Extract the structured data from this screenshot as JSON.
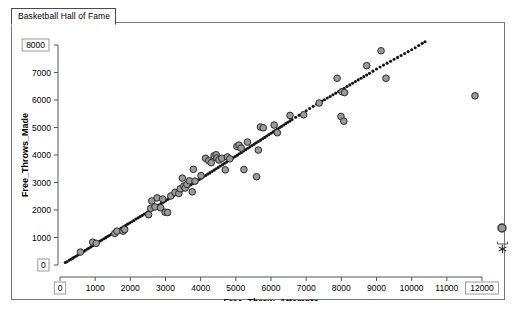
{
  "window": {
    "tab_label": "Basketball Hall of Fame"
  },
  "axis_boxes": {
    "y_max_label": "8000",
    "y_min_label": "0",
    "x_min_label": "0",
    "x_max_label": "12000"
  },
  "tools": {
    "point_icon_name": "circle-point-icon",
    "star_icon_name": "asterisk-icon"
  },
  "chart_data": {
    "type": "scatter",
    "title": "Basketball Hall of Fame",
    "xlabel": "Free_Throw_Attempts",
    "ylabel": "Free_Throws_Made",
    "xlim": [
      0,
      12000
    ],
    "ylim": [
      0,
      8000
    ],
    "xticks": [
      0,
      1000,
      2000,
      3000,
      4000,
      5000,
      6000,
      7000,
      8000,
      9000,
      10000,
      11000,
      12000
    ],
    "yticks": [
      0,
      1000,
      2000,
      3000,
      4000,
      5000,
      6000,
      7000,
      8000
    ],
    "xtick_labels": [
      "0",
      "1000",
      "2000",
      "3000",
      "4000",
      "5000",
      "6000",
      "7000",
      "8000",
      "9000",
      "10000",
      "11000",
      "12000"
    ],
    "ytick_labels": [
      "0",
      "1000",
      "2000",
      "3000",
      "4000",
      "5000",
      "6000",
      "7000",
      "8000"
    ],
    "grid": false,
    "legend": false,
    "marker_fill": "#9a9a9a",
    "marker_edge": "#2b2b2b",
    "dense_color": "#141414",
    "series": [
      {
        "name": "dense_trend_points",
        "marker": "small-dot",
        "color": "#141414",
        "points": [
          [
            150,
            90
          ],
          [
            200,
            120
          ],
          [
            260,
            170
          ],
          [
            310,
            210
          ],
          [
            360,
            250
          ],
          [
            410,
            290
          ],
          [
            470,
            330
          ],
          [
            520,
            375
          ],
          [
            570,
            415
          ],
          [
            620,
            455
          ],
          [
            670,
            495
          ],
          [
            720,
            535
          ],
          [
            780,
            580
          ],
          [
            830,
            620
          ],
          [
            880,
            660
          ],
          [
            930,
            700
          ],
          [
            980,
            740
          ],
          [
            1040,
            790
          ],
          [
            1090,
            830
          ],
          [
            1140,
            870
          ],
          [
            1190,
            910
          ],
          [
            1250,
            955
          ],
          [
            1300,
            995
          ],
          [
            1350,
            1035
          ],
          [
            1400,
            1075
          ],
          [
            1460,
            1120
          ],
          [
            1510,
            1160
          ],
          [
            1560,
            1200
          ],
          [
            1620,
            1250
          ],
          [
            1680,
            1300
          ],
          [
            1740,
            1345
          ],
          [
            1800,
            1390
          ],
          [
            1860,
            1435
          ],
          [
            1920,
            1485
          ],
          [
            1980,
            1530
          ],
          [
            2040,
            1575
          ],
          [
            2100,
            1620
          ],
          [
            2160,
            1670
          ],
          [
            2220,
            1715
          ],
          [
            2280,
            1760
          ],
          [
            2340,
            1805
          ],
          [
            2400,
            1855
          ],
          [
            2460,
            1900
          ],
          [
            2520,
            1950
          ],
          [
            2580,
            1995
          ],
          [
            2640,
            2045
          ],
          [
            2700,
            2095
          ],
          [
            2760,
            2140
          ],
          [
            2820,
            2190
          ],
          [
            2880,
            2240
          ],
          [
            2940,
            2285
          ],
          [
            3000,
            2330
          ],
          [
            3060,
            2380
          ],
          [
            3120,
            2430
          ],
          [
            3180,
            2475
          ],
          [
            3240,
            2525
          ],
          [
            3300,
            2575
          ],
          [
            3360,
            2620
          ],
          [
            3420,
            2670
          ],
          [
            3480,
            2720
          ],
          [
            3540,
            2770
          ],
          [
            3600,
            2815
          ],
          [
            3660,
            2865
          ],
          [
            3720,
            2915
          ],
          [
            3780,
            2960
          ],
          [
            3840,
            3010
          ],
          [
            3900,
            3060
          ],
          [
            3960,
            3110
          ],
          [
            4020,
            3155
          ],
          [
            4080,
            3205
          ],
          [
            4140,
            3255
          ],
          [
            4200,
            3305
          ],
          [
            4260,
            3350
          ],
          [
            4320,
            3400
          ],
          [
            4380,
            3450
          ],
          [
            4440,
            3500
          ],
          [
            4500,
            3550
          ],
          [
            4560,
            3600
          ],
          [
            4620,
            3650
          ],
          [
            4680,
            3700
          ],
          [
            4740,
            3750
          ],
          [
            4800,
            3800
          ],
          [
            4860,
            3845
          ],
          [
            4920,
            3895
          ],
          [
            4980,
            3945
          ],
          [
            5040,
            3995
          ],
          [
            5100,
            4045
          ],
          [
            5160,
            4095
          ],
          [
            5220,
            4145
          ],
          [
            5280,
            4195
          ],
          [
            5340,
            4245
          ],
          [
            5400,
            4295
          ],
          [
            5460,
            4345
          ],
          [
            5520,
            4395
          ],
          [
            5580,
            4445
          ],
          [
            5640,
            4490
          ],
          [
            5700,
            4540
          ],
          [
            5760,
            4590
          ],
          [
            5820,
            4640
          ],
          [
            5880,
            4690
          ],
          [
            5940,
            4740
          ],
          [
            6000,
            4790
          ],
          [
            6060,
            4840
          ],
          [
            6120,
            4890
          ],
          [
            6180,
            4940
          ],
          [
            6240,
            4990
          ],
          [
            6300,
            5040
          ],
          [
            6360,
            5090
          ],
          [
            6420,
            5140
          ],
          [
            6480,
            5190
          ],
          [
            6540,
            5240
          ],
          [
            6600,
            5290
          ],
          [
            6700,
            5370
          ],
          [
            6800,
            5450
          ],
          [
            6900,
            5530
          ],
          [
            7000,
            5610
          ],
          [
            7100,
            5690
          ],
          [
            7200,
            5770
          ],
          [
            7300,
            5850
          ],
          [
            7380,
            5910
          ],
          [
            7450,
            5960
          ],
          [
            7520,
            6010
          ],
          [
            7600,
            6070
          ],
          [
            7680,
            6130
          ],
          [
            7760,
            6190
          ],
          [
            7840,
            6250
          ],
          [
            7920,
            6310
          ],
          [
            8000,
            6370
          ],
          [
            8080,
            6430
          ],
          [
            8160,
            6490
          ],
          [
            8240,
            6550
          ],
          [
            8320,
            6610
          ],
          [
            8400,
            6670
          ],
          [
            8480,
            6730
          ],
          [
            8560,
            6790
          ],
          [
            8640,
            6850
          ],
          [
            8720,
            6910
          ],
          [
            8800,
            6970
          ],
          [
            8900,
            7050
          ],
          [
            9000,
            7130
          ],
          [
            9100,
            7200
          ],
          [
            9200,
            7270
          ],
          [
            9300,
            7340
          ],
          [
            9400,
            7410
          ],
          [
            9500,
            7480
          ],
          [
            9600,
            7550
          ],
          [
            9700,
            7620
          ],
          [
            9800,
            7690
          ],
          [
            9900,
            7760
          ],
          [
            10000,
            7830
          ],
          [
            10100,
            7900
          ],
          [
            10200,
            7980
          ],
          [
            10300,
            8060
          ],
          [
            10380,
            8120
          ]
        ]
      },
      {
        "name": "highlighted_players",
        "marker": "circle",
        "color": "#9a9a9a",
        "points": [
          [
            580,
            470
          ],
          [
            930,
            830
          ],
          [
            1030,
            790
          ],
          [
            1560,
            1150
          ],
          [
            1620,
            1230
          ],
          [
            1790,
            1230
          ],
          [
            1840,
            1290
          ],
          [
            2520,
            1830
          ],
          [
            2580,
            2060
          ],
          [
            2610,
            2330
          ],
          [
            2700,
            2110
          ],
          [
            2760,
            2440
          ],
          [
            2860,
            2080
          ],
          [
            2920,
            2400
          ],
          [
            2990,
            1920
          ],
          [
            3060,
            1910
          ],
          [
            3150,
            2510
          ],
          [
            3270,
            2640
          ],
          [
            3380,
            2600
          ],
          [
            3420,
            2770
          ],
          [
            3480,
            3160
          ],
          [
            3520,
            2870
          ],
          [
            3560,
            2800
          ],
          [
            3610,
            2930
          ],
          [
            3680,
            3060
          ],
          [
            3760,
            2660
          ],
          [
            3790,
            3480
          ],
          [
            3840,
            3050
          ],
          [
            4010,
            3250
          ],
          [
            4140,
            3880
          ],
          [
            4230,
            3790
          ],
          [
            4300,
            3720
          ],
          [
            4380,
            3970
          ],
          [
            4440,
            4010
          ],
          [
            4460,
            3890
          ],
          [
            4520,
            3820
          ],
          [
            4600,
            3880
          ],
          [
            4700,
            3460
          ],
          [
            4760,
            3930
          ],
          [
            4830,
            3860
          ],
          [
            5030,
            4310
          ],
          [
            5090,
            4360
          ],
          [
            5150,
            4250
          ],
          [
            5230,
            3470
          ],
          [
            5330,
            4470
          ],
          [
            5590,
            3210
          ],
          [
            5640,
            4180
          ],
          [
            5700,
            5020
          ],
          [
            5780,
            4990
          ],
          [
            6090,
            5090
          ],
          [
            6180,
            4810
          ],
          [
            6540,
            5440
          ],
          [
            6930,
            5460
          ],
          [
            7370,
            5890
          ],
          [
            7880,
            6790
          ],
          [
            7990,
            5400
          ],
          [
            8020,
            6300
          ],
          [
            8070,
            5230
          ],
          [
            8090,
            6270
          ],
          [
            8720,
            7250
          ],
          [
            9130,
            7790
          ],
          [
            9270,
            6790
          ],
          [
            11800,
            6150
          ]
        ]
      }
    ]
  }
}
